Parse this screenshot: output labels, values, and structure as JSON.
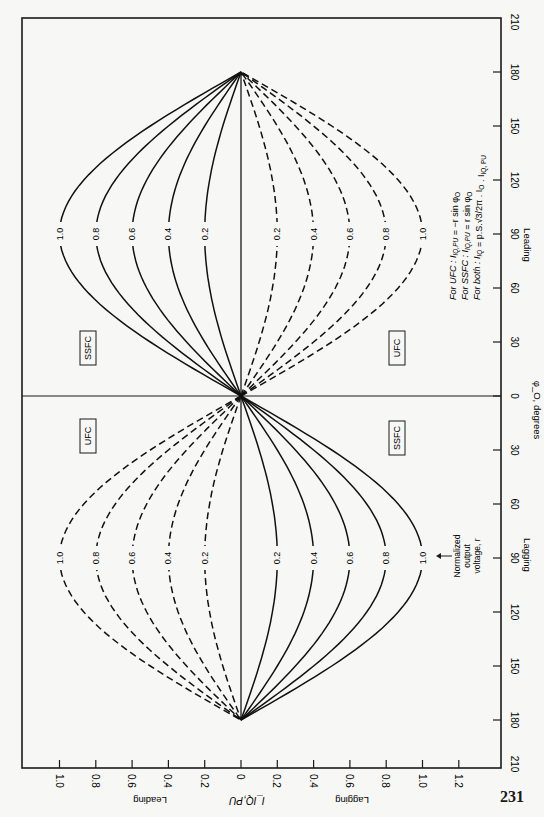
{
  "page_number": "231",
  "chart_data": {
    "type": "line",
    "orientation": "rotated-90",
    "title": "",
    "xlabel": "I_IQ,PU",
    "ylabel": "φ_O, degrees",
    "x_axis": {
      "ticks": [
        -1.0,
        -0.8,
        -0.6,
        -0.4,
        -0.2,
        0,
        0.2,
        0.4,
        0.6,
        0.8,
        1.0,
        1.2
      ],
      "tick_labels": [
        "1.0",
        "0.8",
        "0.6",
        "0.4",
        "0.2",
        "0",
        "0.2",
        "0.4",
        "0.6",
        "0.8",
        "1.0",
        "1.2"
      ],
      "side_labels": {
        "negative": "Leading",
        "positive": "Lagging"
      }
    },
    "y_axis": {
      "ticks": [
        -210,
        -180,
        -150,
        -120,
        -90,
        -60,
        -30,
        0,
        30,
        60,
        90,
        120,
        150,
        180,
        210
      ],
      "tick_labels": [
        "210",
        "180",
        "150",
        "120",
        "90",
        "60",
        "30",
        "0",
        "30",
        "60",
        "90",
        "120",
        "150",
        "180",
        "210"
      ],
      "side_labels": {
        "negative": "Lagging",
        "positive": "Leading"
      },
      "range": [
        -210,
        210
      ]
    },
    "xlim": [
      -1.2,
      1.4
    ],
    "ylim": [
      -210,
      210
    ],
    "parameter": "Normalized output voltage, r",
    "r_values": [
      0.2,
      0.4,
      0.6,
      0.8,
      1.0
    ],
    "series": [
      {
        "name": "UFC",
        "style": "solid",
        "formula": "I_IQ,PU = -r sin φ_O",
        "r": [
          0.2,
          0.4,
          0.6,
          0.8,
          1.0
        ],
        "phi": [
          -180,
          -150,
          -120,
          -90,
          -60,
          -30,
          0,
          30,
          60,
          90,
          120,
          150,
          180
        ],
        "values_r1": [
          0,
          0.5,
          0.866,
          1.0,
          0.866,
          0.5,
          0,
          -0.5,
          -0.866,
          -1.0,
          -0.866,
          -0.5,
          0
        ]
      },
      {
        "name": "SSFC",
        "style": "dashed",
        "formula": "I_IQ,PU = r sin φ_O",
        "r": [
          0.2,
          0.4,
          0.6,
          0.8,
          1.0
        ],
        "phi": [
          -180,
          -150,
          -120,
          -90,
          -60,
          -30,
          0,
          30,
          60,
          90,
          120,
          150,
          180
        ],
        "values_r1": [
          0,
          -0.5,
          -0.866,
          -1.0,
          -0.866,
          -0.5,
          0,
          0.5,
          0.866,
          1.0,
          0.866,
          0.5,
          0
        ]
      }
    ],
    "region_labels": [
      "SSFC",
      "UFC",
      "UFC",
      "SSFC"
    ],
    "annotations": [
      "For UFC : I_IQ,PU = −r sin φ_O",
      "For SSFC : I_IQ,PU = r sin φ_O",
      "For both : I_IQ = p·S·(√3/2π)·I_O·I_IQ,PU",
      "Normalized output voltage, r"
    ],
    "grid": false,
    "legend": null
  },
  "labels": {
    "x_axis_title": "I_IQ,PU",
    "x_leading": "Leading",
    "x_lagging": "Lagging",
    "y_axis_title": "φ_O, degrees",
    "y_leading": "Leading",
    "y_lagging": "Lagging",
    "box_ssfc": "SSFC",
    "box_ufc": "UFC",
    "formula_ufc": "For UFC  :  I",
    "formula_ssfc": "For SSFC :  I",
    "formula_both": "For both :  I",
    "arrow_note_1": "Normalized",
    "arrow_note_2": "output",
    "arrow_note_3": "voltage, r"
  }
}
